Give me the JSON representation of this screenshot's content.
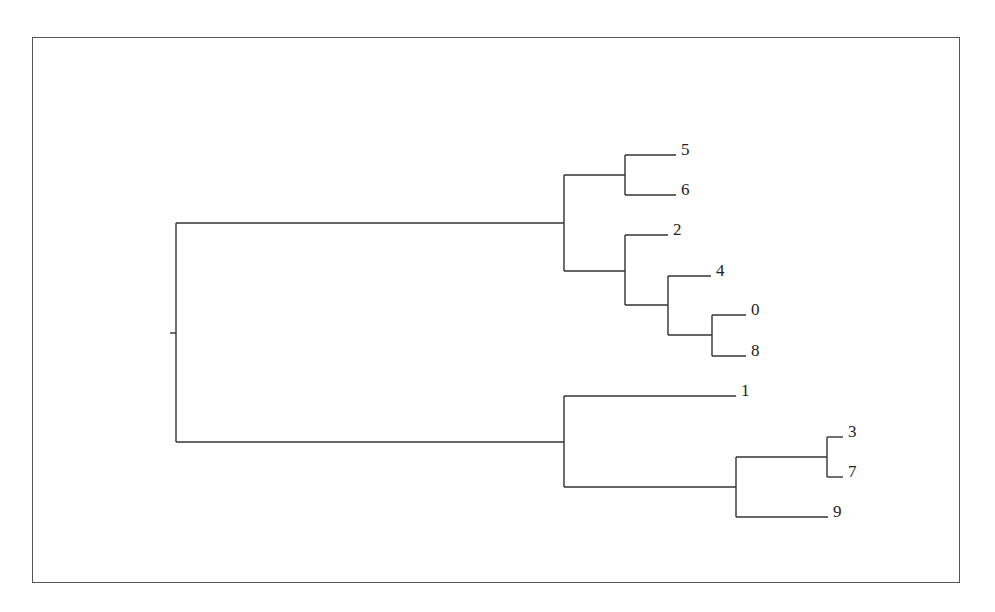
{
  "chart_data": {
    "type": "dendrogram",
    "orientation": "left-to-right",
    "leaves_order": [
      "5",
      "6",
      "2",
      "4",
      "0",
      "8",
      "1",
      "3",
      "7",
      "9"
    ],
    "tree": {
      "children": [
        {
          "children": [
            {
              "children": [
                {
                  "label": "5"
                },
                {
                  "label": "6"
                }
              ]
            },
            {
              "children": [
                {
                  "label": "2"
                },
                {
                  "children": [
                    {
                      "label": "4"
                    },
                    {
                      "children": [
                        {
                          "label": "0"
                        },
                        {
                          "label": "8"
                        }
                      ]
                    }
                  ]
                }
              ]
            }
          ]
        },
        {
          "children": [
            {
              "label": "1"
            },
            {
              "children": [
                {
                  "children": [
                    {
                      "label": "3"
                    },
                    {
                      "label": "7"
                    }
                  ]
                },
                {
                  "label": "9"
                }
              ]
            }
          ]
        }
      ]
    },
    "axis": "none",
    "grid": false,
    "legend": "none"
  },
  "geometry": {
    "stub": {
      "x1": 170,
      "x2": 176,
      "y": 333
    },
    "nodes": [
      {
        "name": "root",
        "x": 176,
        "y1": 223,
        "y2": 442,
        "parent_x": 170,
        "mid": 333
      },
      {
        "name": "clade-A",
        "x": 564,
        "y1": 175,
        "y2": 271,
        "parent_x": 176,
        "mid": 223
      },
      {
        "name": "clade-5-6",
        "x": 625,
        "y1": 155,
        "y2": 195,
        "parent_x": 564,
        "mid": 175
      },
      {
        "name": "clade-2-4-0-8",
        "x": 625,
        "y1": 235,
        "y2": 305,
        "parent_x": 564,
        "mid": 271
      },
      {
        "name": "clade-4-0-8",
        "x": 668,
        "y1": 276,
        "y2": 335,
        "parent_x": 625,
        "mid": 305
      },
      {
        "name": "clade-0-8",
        "x": 712,
        "y1": 315,
        "y2": 356,
        "parent_x": 668,
        "mid": 335
      },
      {
        "name": "clade-B",
        "x": 564,
        "y1": 396,
        "y2": 487,
        "parent_x": 176,
        "mid": 442
      },
      {
        "name": "clade-3-7-9",
        "x": 736,
        "y1": 457,
        "y2": 517,
        "parent_x": 564,
        "mid": 487
      },
      {
        "name": "clade-3-7",
        "x": 827,
        "y1": 437,
        "y2": 477,
        "parent_x": 736,
        "mid": 457
      }
    ],
    "leaves": [
      {
        "label": "5",
        "x1": 625,
        "x2": 676,
        "y": 155
      },
      {
        "label": "6",
        "x1": 625,
        "x2": 676,
        "y": 195
      },
      {
        "label": "2",
        "x1": 625,
        "x2": 668,
        "y": 235
      },
      {
        "label": "4",
        "x1": 668,
        "x2": 711,
        "y": 276
      },
      {
        "label": "0",
        "x1": 712,
        "x2": 746,
        "y": 315
      },
      {
        "label": "8",
        "x1": 712,
        "x2": 746,
        "y": 356
      },
      {
        "label": "1",
        "x1": 564,
        "x2": 736,
        "y": 396
      },
      {
        "label": "3",
        "x1": 827,
        "x2": 843,
        "y": 437
      },
      {
        "label": "7",
        "x1": 827,
        "x2": 843,
        "y": 477
      },
      {
        "label": "9",
        "x1": 736,
        "x2": 828,
        "y": 517
      }
    ]
  }
}
